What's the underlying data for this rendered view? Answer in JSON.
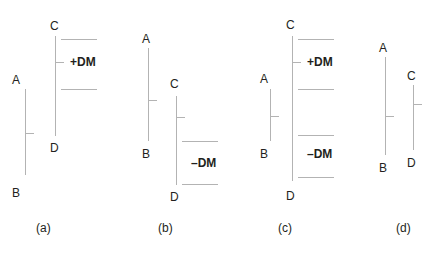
{
  "figure": {
    "width": 431,
    "height": 259,
    "background": "#ffffff",
    "line_color": "#b3b3b3",
    "text_color": "#231f20"
  },
  "panels": [
    {
      "id": "a",
      "caption": "(a)",
      "caption_x": 36,
      "caption_y": 222,
      "description": "Prior bar A-B lower, current bar C-D higher; upward movement only, so +DM is recorded",
      "bars": [
        {
          "name": "prior-bar",
          "high_label": "A",
          "low_label": "B",
          "x": 25,
          "top_y": 89,
          "bottom_y": 175,
          "high_label_x": 12,
          "high_label_y": 74,
          "low_label_x": 12,
          "low_label_y": 187,
          "tick_y": 133,
          "tick_x": 25,
          "tick_width": 9
        },
        {
          "name": "current-bar",
          "high_label": "C",
          "low_label": "D",
          "x": 55,
          "top_y": 36,
          "bottom_y": 136,
          "high_label_x": 50,
          "high_label_y": 20,
          "low_label_x": 50,
          "low_label_y": 142,
          "tick_y": 62,
          "tick_x": 55,
          "tick_width": 9
        }
      ],
      "zones": [
        {
          "label": "+DM",
          "label_x": 70,
          "label_y": 56,
          "rule_top_y": 39,
          "rule_bottom_y": 89,
          "rule_x": 61,
          "rule_width": 36
        }
      ]
    },
    {
      "id": "b",
      "caption": "(b)",
      "caption_x": 158,
      "caption_y": 222,
      "description": "Prior bar A-B higher, current bar C-D lower; downward movement only, so -DM is recorded",
      "bars": [
        {
          "name": "prior-bar",
          "high_label": "A",
          "low_label": "B",
          "x": 148,
          "top_y": 48,
          "bottom_y": 141,
          "high_label_x": 142,
          "high_label_y": 33,
          "low_label_x": 142,
          "low_label_y": 148,
          "tick_y": 100,
          "tick_x": 148,
          "tick_width": 9
        },
        {
          "name": "current-bar",
          "high_label": "C",
          "low_label": "D",
          "x": 176,
          "top_y": 96,
          "bottom_y": 185,
          "high_label_x": 170,
          "high_label_y": 78,
          "low_label_x": 170,
          "low_label_y": 191,
          "tick_y": 117,
          "tick_x": 176,
          "tick_width": 9
        }
      ],
      "zones": [
        {
          "label": "–DM",
          "label_x": 191,
          "label_y": 157,
          "rule_top_y": 141,
          "rule_bottom_y": 184,
          "rule_x": 182,
          "rule_width": 36
        }
      ]
    },
    {
      "id": "c",
      "caption": "(c)",
      "caption_x": 278,
      "caption_y": 222,
      "description": "Current bar C-D engulfs prior bar A-B; both +DM and -DM are measured, larger one is used",
      "bars": [
        {
          "name": "prior-bar",
          "high_label": "A",
          "low_label": "B",
          "x": 270,
          "top_y": 89,
          "bottom_y": 141,
          "high_label_x": 260,
          "high_label_y": 73,
          "low_label_x": 260,
          "low_label_y": 148,
          "tick_y": 116,
          "tick_x": 270,
          "tick_width": 9
        },
        {
          "name": "current-bar",
          "high_label": "C",
          "low_label": "D",
          "x": 292,
          "top_y": 36,
          "bottom_y": 181,
          "high_label_x": 286,
          "high_label_y": 19,
          "low_label_x": 286,
          "low_label_y": 190,
          "tick_y": 62,
          "tick_x": 292,
          "tick_width": 9
        }
      ],
      "zones": [
        {
          "label": "+DM",
          "label_x": 307,
          "label_y": 56,
          "rule_top_y": 39,
          "rule_bottom_y": 89,
          "rule_x": 298,
          "rule_width": 36
        },
        {
          "label": "–DM",
          "label_x": 307,
          "label_y": 148,
          "rule_top_y": 135,
          "rule_bottom_y": 177,
          "rule_x": 298,
          "rule_width": 36
        }
      ]
    },
    {
      "id": "d",
      "caption": "(d)",
      "caption_x": 396,
      "caption_y": 222,
      "description": "Prior bar A-B engulfs current bar C-D; inside bar, no directional movement is recorded",
      "bars": [
        {
          "name": "prior-bar",
          "high_label": "A",
          "low_label": "B",
          "x": 385,
          "top_y": 57,
          "bottom_y": 155,
          "high_label_x": 379,
          "high_label_y": 42,
          "low_label_x": 379,
          "low_label_y": 162,
          "tick_y": 116,
          "tick_x": 385,
          "tick_width": 9
        },
        {
          "name": "current-bar",
          "high_label": "C",
          "low_label": "D",
          "x": 413,
          "top_y": 85,
          "bottom_y": 150,
          "high_label_x": 407,
          "high_label_y": 70,
          "low_label_x": 407,
          "low_label_y": 157,
          "tick_y": 104,
          "tick_x": 413,
          "tick_width": 9
        }
      ],
      "zones": []
    }
  ]
}
